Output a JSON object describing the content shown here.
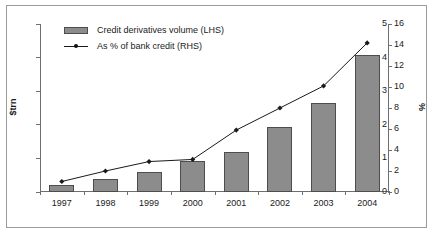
{
  "chart_data": {
    "type": "bar",
    "title": "",
    "subtitle": "",
    "xlabel": "",
    "categories": [
      "1997",
      "1998",
      "1999",
      "2000",
      "2001",
      "2002",
      "2003",
      "2004"
    ],
    "grid": false,
    "legend_position": "top-left",
    "axes": {
      "left": {
        "label": "$trn",
        "ylim": [
          0,
          5
        ],
        "ticks": [
          "0",
          "1",
          "2",
          "3",
          "4",
          "5"
        ],
        "tick_values": [
          0,
          1,
          2,
          3,
          4,
          5
        ]
      },
      "right": {
        "label": "%",
        "ylim": [
          0,
          16
        ],
        "ticks": [
          "0",
          "2",
          "4",
          "6",
          "8",
          "10",
          "12",
          "14",
          "16"
        ],
        "tick_values": [
          0,
          2,
          4,
          6,
          8,
          10,
          12,
          14,
          16
        ]
      }
    },
    "series": [
      {
        "name": "Credit derivatives volume (LHS)",
        "type": "bar",
        "axis": "left",
        "unit": "$trn",
        "color": "#8c8c8c",
        "edge_color": "#4d4d4d",
        "values": [
          0.22,
          0.4,
          0.6,
          0.92,
          1.18,
          1.93,
          2.65,
          4.09
        ]
      },
      {
        "name": "As % of bank credit (RHS)",
        "type": "line",
        "axis": "right",
        "unit": "%",
        "color": "#1a1a1a",
        "marker": "diamond",
        "values": [
          1.0,
          2.0,
          2.9,
          3.1,
          5.9,
          8.0,
          10.1,
          14.2
        ]
      }
    ]
  },
  "legend": {
    "items": [
      {
        "label": "Credit derivatives volume (LHS)",
        "swatch": "bar-swatch"
      },
      {
        "label": "As % of bank credit (RHS)",
        "swatch": "line-marker-swatch"
      }
    ]
  },
  "colors": {
    "bar_fill": "#8c8c8c",
    "bar_edge": "#4d4d4d",
    "line": "#1a1a1a",
    "axis": "#6f6f6f",
    "frame": "#9a9a9a",
    "text": "#1a1a1a",
    "background": "#ffffff"
  }
}
